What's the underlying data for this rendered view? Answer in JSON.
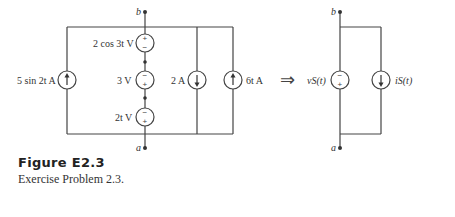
{
  "figure": {
    "title": "Figure  E2.3",
    "caption": "Exercise Problem 2.3."
  },
  "left_circuit": {
    "node_top": "b",
    "node_bottom": "a",
    "sources": [
      {
        "type": "current",
        "label": "5 sin 2t A",
        "direction": "up"
      },
      {
        "type": "voltage",
        "label": "2 cos 3t V",
        "polarity": "plus-top"
      },
      {
        "type": "voltage",
        "label": "3 V",
        "polarity": "minus-top"
      },
      {
        "type": "voltage",
        "label": "2t V",
        "polarity": "minus-top"
      },
      {
        "type": "current",
        "label": "2 A",
        "direction": "down"
      },
      {
        "type": "current",
        "label": "6t A",
        "direction": "up"
      }
    ]
  },
  "equivalence_arrow": "⇒",
  "right_circuit": {
    "node_top": "b",
    "node_bottom": "a",
    "voltage_source": {
      "label": "vS(t)",
      "polarity": "minus-top"
    },
    "current_source": {
      "label": "iS(t)",
      "direction": "down"
    }
  },
  "labels": {
    "b": "b",
    "a": "a",
    "src_5sin": "5 sin 2t A",
    "src_2cos": "2 cos 3t V",
    "src_3v": "3 V",
    "src_2t": "2t V",
    "src_2a": "2 A",
    "src_6t": "6t A",
    "vs": "vS(t)",
    "is": "iS(t)",
    "plus": "+",
    "minus": "−"
  }
}
